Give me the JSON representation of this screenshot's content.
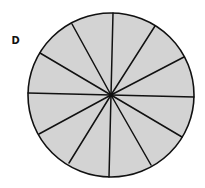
{
  "figure": {
    "label": "D",
    "shape": "circle",
    "segments": 12,
    "center": {
      "x": 111,
      "y": 95
    },
    "radius_x": 83,
    "radius_y": 82,
    "fill_color": "#d3d3d3",
    "stroke_color": "#111111",
    "spoke_endpoints": [
      {
        "x": 113,
        "y": 13
      },
      {
        "x": 155,
        "y": 26
      },
      {
        "x": 184,
        "y": 57
      },
      {
        "x": 194,
        "y": 97
      },
      {
        "x": 182,
        "y": 137
      },
      {
        "x": 151,
        "y": 165
      },
      {
        "x": 109,
        "y": 177
      },
      {
        "x": 69,
        "y": 163
      },
      {
        "x": 39,
        "y": 134
      },
      {
        "x": 28,
        "y": 93
      },
      {
        "x": 40,
        "y": 53
      },
      {
        "x": 72,
        "y": 24
      }
    ]
  }
}
